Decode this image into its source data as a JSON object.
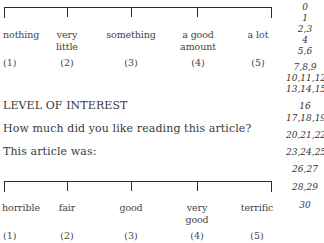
{
  "top_scale": {
    "options": [
      {
        "label": "nothing",
        "label2": "",
        "value": "(1)"
      },
      {
        "label": "very",
        "label2": "little",
        "value": "(2)"
      },
      {
        "label": "something",
        "label2": "",
        "value": "(3)"
      },
      {
        "label": "a good",
        "label2": "amount",
        "value": "(4)"
      },
      {
        "label": "a lot",
        "label2": "",
        "value": "(5)"
      }
    ]
  },
  "section": {
    "title": "LEVEL OF INTEREST",
    "question": "How much did you like reading this article?",
    "prompt": "This article was:"
  },
  "bottom_scale": {
    "options": [
      {
        "label": "horrible",
        "label2": "",
        "value": "(1)"
      },
      {
        "label": "fair",
        "label2": "",
        "value": "(2)"
      },
      {
        "label": "good",
        "label2": "",
        "value": "(3)"
      },
      {
        "label": "very",
        "label2": "good",
        "value": "(4)"
      },
      {
        "label": "terrific",
        "label2": "",
        "value": "(5)"
      }
    ]
  },
  "line_numbers": [
    "0",
    "1",
    "2,3",
    "4",
    "5,6",
    "7,8,9",
    "10,11,12",
    "13,14,15",
    "16",
    "17,18,19",
    "20,21,22",
    "23,24,25",
    "26,27",
    "28,29",
    "30"
  ]
}
